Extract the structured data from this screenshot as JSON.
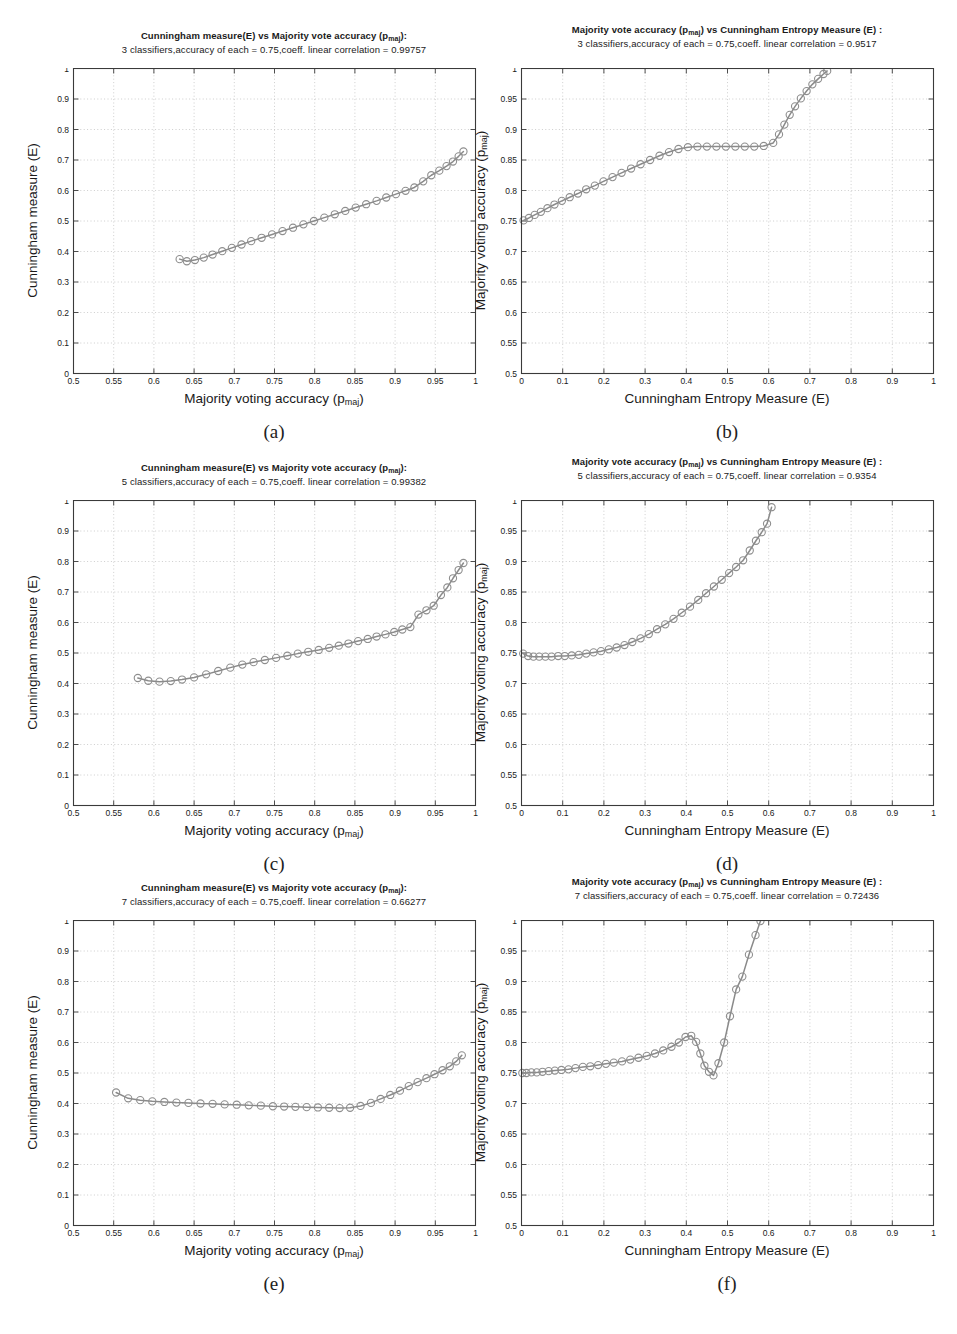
{
  "figure": {
    "caption_labels": [
      "(a)",
      "(b)",
      "(c)",
      "(d)",
      "(e)",
      "(f)"
    ],
    "marker_color": "#8e8e8e",
    "line_color": "#8a8a8a",
    "grid_color": "#b9b9b9",
    "axis_color": "#3a3a3a"
  },
  "labels": {
    "x_majority": "Majority voting accuracy (p",
    "x_majority_sub": "maj",
    "x_majority_end": ")",
    "x_entropy": "Cunningham Entropy Measure (E)",
    "y_cunningham": "Cunningham measure (E)",
    "y_majority": "Majority voting accuracy (p",
    "y_majority_sub": "maj",
    "y_majority_end": ")"
  },
  "titles": {
    "a_line1_pre": "Cunningham measure(E) vs Majority vote accuracy (p",
    "a_line1_sub": "maj",
    "a_line1_post": "):",
    "a_line2": "3 classifiers,accuracy of each = 0.75,coeff. linear correlation = 0.99757",
    "b_line1_pre": "Majority vote accuracy (p",
    "b_line1_sub": "maj",
    "b_line1_post": ") vs Cunningham Entropy Measure (E) :",
    "b_line2": "3 classifiers,accuracy of each = 0.75,coeff. linear correlation = 0.9517",
    "c_line2": "5 classifiers,accuracy of each = 0.75,coeff. linear correlation = 0.99382",
    "d_line2": "5 classifiers,accuracy of each = 0.75,coeff. linear correlation = 0.9354",
    "e_line2": "7 classifiers,accuracy of each = 0.75,coeff. linear correlation = 0.66277",
    "f_line2": "7 classifiers,accuracy of each = 0.75,coeff. linear correlation = 0.72436"
  },
  "chart_data": [
    {
      "id": "a",
      "type": "line",
      "title": "Cunningham measure(E) vs Majority vote accuracy (p_maj): 3 classifiers,accuracy of each = 0.75,coeff. linear correlation = 0.99757",
      "xlabel": "Majority voting accuracy (p_maj)",
      "ylabel": "Cunningham measure (E)",
      "xlim": [
        0.5,
        1
      ],
      "ylim": [
        0,
        1
      ],
      "xticks": [
        0.5,
        0.55,
        0.6,
        0.65,
        0.7,
        0.75,
        0.8,
        0.85,
        0.9,
        0.95,
        1
      ],
      "yticks": [
        0,
        0.1,
        0.2,
        0.3,
        0.4,
        0.5,
        0.6,
        0.7,
        0.8,
        0.9,
        1
      ],
      "xticklabels": [
        "0.5",
        "0.55",
        "0.6",
        "0.65",
        "0.7",
        "0.75",
        "0.8",
        "0.85",
        "0.9",
        "0.95",
        "1"
      ],
      "yticklabels": [
        "0",
        "0.1",
        "0.2",
        "0.3",
        "0.4",
        "0.5",
        "0.6",
        "0.7",
        "0.8",
        "0.9",
        "1"
      ],
      "grid": true,
      "marker": "circle",
      "x": [
        0.632,
        0.641,
        0.651,
        0.662,
        0.673,
        0.685,
        0.697,
        0.709,
        0.721,
        0.734,
        0.747,
        0.76,
        0.773,
        0.786,
        0.799,
        0.812,
        0.825,
        0.838,
        0.851,
        0.864,
        0.877,
        0.889,
        0.901,
        0.913,
        0.924,
        0.935,
        0.945,
        0.955,
        0.964,
        0.972,
        0.979,
        0.985
      ],
      "y": [
        0.375,
        0.368,
        0.372,
        0.38,
        0.39,
        0.401,
        0.412,
        0.423,
        0.434,
        0.445,
        0.456,
        0.467,
        0.478,
        0.489,
        0.5,
        0.511,
        0.522,
        0.533,
        0.544,
        0.555,
        0.566,
        0.577,
        0.588,
        0.599,
        0.61,
        0.63,
        0.65,
        0.665,
        0.68,
        0.695,
        0.712,
        0.728
      ]
    },
    {
      "id": "b",
      "type": "line",
      "title": "Majority vote accuracy (p_maj) vs Cunningham Entropy Measure (E) : 3 classifiers,accuracy of each = 0.75,coeff. linear correlation = 0.9517",
      "xlabel": "Cunningham Entropy Measure (E)",
      "ylabel": "Majority voting accuracy (p_maj)",
      "xlim": [
        0,
        1
      ],
      "ylim": [
        0.5,
        1
      ],
      "xticks": [
        0,
        0.1,
        0.2,
        0.3,
        0.4,
        0.5,
        0.6,
        0.7,
        0.8,
        0.9,
        1
      ],
      "yticks": [
        0.5,
        0.55,
        0.6,
        0.65,
        0.7,
        0.75,
        0.8,
        0.85,
        0.9,
        0.95,
        1
      ],
      "xticklabels": [
        "0",
        "0.1",
        "0.2",
        "0.3",
        "0.4",
        "0.5",
        "0.6",
        "0.7",
        "0.8",
        "0.9",
        "1"
      ],
      "yticklabels": [
        "0.5",
        "0.55",
        "0.6",
        "0.65",
        "0.7",
        "0.75",
        "0.8",
        "0.85",
        "0.9",
        "0.95",
        "1"
      ],
      "grid": true,
      "marker": "circle",
      "x": [
        0.005,
        0.018,
        0.032,
        0.047,
        0.063,
        0.08,
        0.098,
        0.117,
        0.137,
        0.157,
        0.178,
        0.199,
        0.221,
        0.243,
        0.266,
        0.289,
        0.312,
        0.335,
        0.358,
        0.381,
        0.404,
        0.427,
        0.45,
        0.473,
        0.496,
        0.519,
        0.542,
        0.565,
        0.588,
        0.611,
        0.625,
        0.638,
        0.651,
        0.664,
        0.678,
        0.692,
        0.706,
        0.72,
        0.733,
        0.742
      ],
      "y": [
        0.751,
        0.755,
        0.76,
        0.765,
        0.771,
        0.777,
        0.783,
        0.789,
        0.795,
        0.802,
        0.808,
        0.815,
        0.822,
        0.829,
        0.836,
        0.843,
        0.85,
        0.857,
        0.863,
        0.868,
        0.871,
        0.872,
        0.872,
        0.872,
        0.872,
        0.872,
        0.872,
        0.872,
        0.873,
        0.878,
        0.892,
        0.908,
        0.924,
        0.938,
        0.951,
        0.963,
        0.974,
        0.983,
        0.991,
        0.996
      ]
    },
    {
      "id": "c",
      "type": "line",
      "title": "Cunningham measure(E) vs Majority vote accuracy (p_maj): 5 classifiers,accuracy of each = 0.75,coeff. linear correlation = 0.99382",
      "xlabel": "Majority voting accuracy (p_maj)",
      "ylabel": "Cunningham measure (E)",
      "xlim": [
        0.5,
        1
      ],
      "ylim": [
        0,
        1
      ],
      "xticks": [
        0.5,
        0.55,
        0.6,
        0.65,
        0.7,
        0.75,
        0.8,
        0.85,
        0.9,
        0.95,
        1
      ],
      "yticks": [
        0,
        0.1,
        0.2,
        0.3,
        0.4,
        0.5,
        0.6,
        0.7,
        0.8,
        0.9,
        1
      ],
      "xticklabels": [
        "0.5",
        "0.55",
        "0.6",
        "0.65",
        "0.7",
        "0.75",
        "0.8",
        "0.85",
        "0.9",
        "0.95",
        "1"
      ],
      "yticklabels": [
        "0",
        "0.1",
        "0.2",
        "0.3",
        "0.4",
        "0.5",
        "0.6",
        "0.7",
        "0.8",
        "0.9",
        "1"
      ],
      "grid": true,
      "marker": "circle",
      "x": [
        0.58,
        0.593,
        0.607,
        0.621,
        0.635,
        0.65,
        0.665,
        0.68,
        0.695,
        0.71,
        0.724,
        0.738,
        0.752,
        0.766,
        0.779,
        0.792,
        0.805,
        0.818,
        0.83,
        0.842,
        0.854,
        0.866,
        0.877,
        0.888,
        0.899,
        0.909,
        0.919,
        0.929,
        0.939,
        0.948,
        0.957,
        0.965,
        0.972,
        0.979,
        0.985
      ],
      "y": [
        0.418,
        0.409,
        0.406,
        0.408,
        0.413,
        0.42,
        0.43,
        0.441,
        0.452,
        0.462,
        0.47,
        0.477,
        0.484,
        0.491,
        0.498,
        0.504,
        0.51,
        0.517,
        0.524,
        0.531,
        0.539,
        0.546,
        0.554,
        0.561,
        0.569,
        0.577,
        0.585,
        0.626,
        0.64,
        0.655,
        0.69,
        0.715,
        0.745,
        0.772,
        0.795
      ]
    },
    {
      "id": "d",
      "type": "line",
      "title": "Majority vote accuracy (p_maj) vs Cunningham Entropy Measure (E) : 5 classifiers,accuracy of each = 0.75,coeff. linear correlation = 0.9354",
      "xlabel": "Cunningham Entropy Measure (E)",
      "ylabel": "Majority voting accuracy (p_maj)",
      "xlim": [
        0,
        1
      ],
      "ylim": [
        0.5,
        1
      ],
      "xticks": [
        0,
        0.1,
        0.2,
        0.3,
        0.4,
        0.5,
        0.6,
        0.7,
        0.8,
        0.9,
        1
      ],
      "yticks": [
        0.5,
        0.55,
        0.6,
        0.65,
        0.7,
        0.75,
        0.8,
        0.85,
        0.9,
        0.95,
        1
      ],
      "xticklabels": [
        "0",
        "0.1",
        "0.2",
        "0.3",
        "0.4",
        "0.5",
        "0.6",
        "0.7",
        "0.8",
        "0.9",
        "1"
      ],
      "yticklabels": [
        "0.5",
        "0.55",
        "0.6",
        "0.65",
        "0.7",
        "0.75",
        "0.8",
        "0.85",
        "0.9",
        "0.95",
        "1"
      ],
      "grid": true,
      "marker": "circle",
      "x": [
        0.004,
        0.016,
        0.029,
        0.043,
        0.058,
        0.073,
        0.089,
        0.105,
        0.122,
        0.139,
        0.157,
        0.175,
        0.193,
        0.212,
        0.231,
        0.25,
        0.269,
        0.289,
        0.309,
        0.329,
        0.349,
        0.369,
        0.389,
        0.409,
        0.429,
        0.448,
        0.467,
        0.486,
        0.504,
        0.521,
        0.538,
        0.554,
        0.569,
        0.583,
        0.596,
        0.607
      ],
      "y": [
        0.749,
        0.745,
        0.744,
        0.744,
        0.744,
        0.744,
        0.745,
        0.745,
        0.746,
        0.747,
        0.749,
        0.751,
        0.753,
        0.756,
        0.759,
        0.763,
        0.768,
        0.774,
        0.781,
        0.789,
        0.797,
        0.806,
        0.816,
        0.826,
        0.837,
        0.848,
        0.859,
        0.87,
        0.881,
        0.891,
        0.902,
        0.918,
        0.934,
        0.948,
        0.962,
        0.989
      ]
    },
    {
      "id": "e",
      "type": "line",
      "title": "Cunningham measure(E) vs Majority vote accuracy (p_maj): 7 classifiers,accuracy of each = 0.75,coeff. linear correlation = 0.66277",
      "xlabel": "Majority voting accuracy (p_maj)",
      "ylabel": "Cunningham measure (E)",
      "xlim": [
        0.5,
        1
      ],
      "ylim": [
        0,
        1
      ],
      "xticks": [
        0.5,
        0.55,
        0.6,
        0.65,
        0.7,
        0.75,
        0.8,
        0.85,
        0.9,
        0.95,
        1
      ],
      "yticks": [
        0,
        0.1,
        0.2,
        0.3,
        0.4,
        0.5,
        0.6,
        0.7,
        0.8,
        0.9,
        1
      ],
      "xticklabels": [
        "0.5",
        "0.55",
        "0.6",
        "0.65",
        "0.7",
        "0.75",
        "0.8",
        "0.85",
        "0.9",
        "0.95",
        "1"
      ],
      "yticklabels": [
        "0",
        "0.1",
        "0.2",
        "0.3",
        "0.4",
        "0.5",
        "0.6",
        "0.7",
        "0.8",
        "0.9",
        "1"
      ],
      "grid": true,
      "marker": "circle",
      "x": [
        0.553,
        0.568,
        0.583,
        0.598,
        0.613,
        0.628,
        0.643,
        0.658,
        0.673,
        0.688,
        0.703,
        0.718,
        0.733,
        0.748,
        0.762,
        0.776,
        0.79,
        0.804,
        0.818,
        0.831,
        0.844,
        0.857,
        0.87,
        0.882,
        0.894,
        0.906,
        0.917,
        0.928,
        0.939,
        0.949,
        0.959,
        0.968,
        0.976,
        0.983
      ],
      "y": [
        0.436,
        0.417,
        0.411,
        0.407,
        0.405,
        0.403,
        0.402,
        0.4,
        0.399,
        0.397,
        0.396,
        0.394,
        0.393,
        0.391,
        0.39,
        0.389,
        0.388,
        0.387,
        0.386,
        0.385,
        0.386,
        0.392,
        0.402,
        0.415,
        0.428,
        0.442,
        0.457,
        0.47,
        0.483,
        0.496,
        0.509,
        0.522,
        0.538,
        0.558
      ]
    },
    {
      "id": "f",
      "type": "line",
      "title": "Majority vote accuracy (p_maj) vs Cunningham Entropy Measure (E) : 7 classifiers,accuracy of each = 0.75,coeff. linear correlation = 0.72436",
      "xlabel": "Cunningham Entropy Measure (E)",
      "ylabel": "Majority voting accuracy (p_maj)",
      "xlim": [
        0,
        1
      ],
      "ylim": [
        0.5,
        1
      ],
      "xticks": [
        0,
        0.1,
        0.2,
        0.3,
        0.4,
        0.5,
        0.6,
        0.7,
        0.8,
        0.9,
        1
      ],
      "yticks": [
        0.5,
        0.55,
        0.6,
        0.65,
        0.7,
        0.75,
        0.8,
        0.85,
        0.9,
        0.95,
        1
      ],
      "xticklabels": [
        "0",
        "0.1",
        "0.2",
        "0.3",
        "0.4",
        "0.5",
        "0.6",
        "0.7",
        "0.8",
        "0.9",
        "1"
      ],
      "yticklabels": [
        "0.5",
        "0.55",
        "0.6",
        "0.65",
        "0.7",
        "0.75",
        "0.8",
        "0.85",
        "0.9",
        "0.95",
        "1"
      ],
      "grid": true,
      "marker": "circle",
      "x": [
        0.002,
        0.012,
        0.024,
        0.037,
        0.051,
        0.066,
        0.081,
        0.097,
        0.114,
        0.131,
        0.149,
        0.167,
        0.186,
        0.205,
        0.224,
        0.244,
        0.264,
        0.284,
        0.304,
        0.324,
        0.344,
        0.364,
        0.382,
        0.398,
        0.412,
        0.424,
        0.434,
        0.444,
        0.455,
        0.466,
        0.478,
        0.492,
        0.506,
        0.521,
        0.536,
        0.552,
        0.568,
        0.58
      ],
      "y": [
        0.75,
        0.75,
        0.751,
        0.751,
        0.752,
        0.753,
        0.754,
        0.755,
        0.756,
        0.758,
        0.76,
        0.761,
        0.763,
        0.765,
        0.767,
        0.769,
        0.772,
        0.775,
        0.778,
        0.782,
        0.787,
        0.793,
        0.8,
        0.809,
        0.811,
        0.801,
        0.782,
        0.762,
        0.752,
        0.746,
        0.766,
        0.8,
        0.843,
        0.887,
        0.908,
        0.944,
        0.976,
        0.999
      ]
    }
  ]
}
